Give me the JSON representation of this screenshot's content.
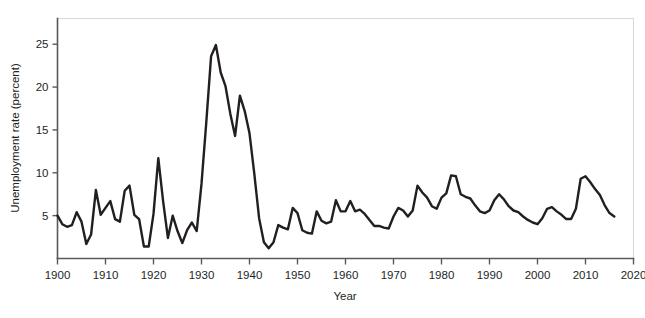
{
  "chart_data": {
    "type": "line",
    "title": "",
    "xlabel": "Year",
    "ylabel": "Unemployment rate (percent)",
    "xlim": [
      1900,
      2020
    ],
    "ylim": [
      0,
      28
    ],
    "xticks": [
      1900,
      1910,
      1920,
      1930,
      1940,
      1950,
      1960,
      1970,
      1980,
      1990,
      2000,
      2010,
      2020
    ],
    "yticks": [
      5,
      10,
      15,
      20,
      25
    ],
    "grid": false,
    "legend": null,
    "line_color": "#231f20",
    "series": [
      {
        "name": "Unemployment rate",
        "x": [
          1900,
          1901,
          1902,
          1903,
          1904,
          1905,
          1906,
          1907,
          1908,
          1909,
          1910,
          1911,
          1912,
          1913,
          1914,
          1915,
          1916,
          1917,
          1918,
          1919,
          1920,
          1921,
          1922,
          1923,
          1924,
          1925,
          1926,
          1927,
          1928,
          1929,
          1930,
          1931,
          1932,
          1933,
          1934,
          1935,
          1936,
          1937,
          1938,
          1939,
          1940,
          1941,
          1942,
          1943,
          1944,
          1945,
          1946,
          1947,
          1948,
          1949,
          1950,
          1951,
          1952,
          1953,
          1954,
          1955,
          1956,
          1957,
          1958,
          1959,
          1960,
          1961,
          1962,
          1963,
          1964,
          1965,
          1966,
          1967,
          1968,
          1969,
          1970,
          1971,
          1972,
          1973,
          1974,
          1975,
          1976,
          1977,
          1978,
          1979,
          1980,
          1981,
          1982,
          1983,
          1984,
          1985,
          1986,
          1987,
          1988,
          1989,
          1990,
          1991,
          1992,
          1993,
          1994,
          1995,
          1996,
          1997,
          1998,
          1999,
          2000,
          2001,
          2002,
          2003,
          2004,
          2005,
          2006,
          2007,
          2008,
          2009,
          2010,
          2011,
          2012,
          2013,
          2014,
          2015,
          2016
        ],
        "values": [
          5.0,
          4.0,
          3.7,
          3.9,
          5.4,
          4.3,
          1.7,
          2.8,
          8.0,
          5.1,
          5.9,
          6.7,
          4.6,
          4.3,
          7.9,
          8.5,
          5.1,
          4.6,
          1.4,
          1.4,
          5.2,
          11.7,
          6.7,
          2.4,
          5.0,
          3.2,
          1.8,
          3.3,
          4.2,
          3.2,
          8.7,
          15.9,
          23.6,
          24.9,
          21.7,
          20.1,
          16.9,
          14.3,
          19.0,
          17.2,
          14.6,
          9.9,
          4.7,
          1.9,
          1.2,
          1.9,
          3.9,
          3.6,
          3.4,
          5.9,
          5.3,
          3.3,
          3.0,
          2.9,
          5.5,
          4.4,
          4.1,
          4.3,
          6.8,
          5.5,
          5.5,
          6.7,
          5.5,
          5.7,
          5.2,
          4.5,
          3.8,
          3.8,
          3.6,
          3.5,
          4.9,
          5.9,
          5.6,
          4.9,
          5.6,
          8.5,
          7.7,
          7.1,
          6.1,
          5.8,
          7.1,
          7.6,
          9.7,
          9.6,
          7.5,
          7.2,
          7.0,
          6.2,
          5.5,
          5.3,
          5.6,
          6.8,
          7.5,
          6.9,
          6.1,
          5.6,
          5.4,
          4.9,
          4.5,
          4.2,
          4.0,
          4.7,
          5.8,
          6.0,
          5.5,
          5.1,
          4.6,
          4.6,
          5.8,
          9.3,
          9.6,
          8.9,
          8.1,
          7.4,
          6.2,
          5.3,
          4.9
        ]
      }
    ]
  }
}
